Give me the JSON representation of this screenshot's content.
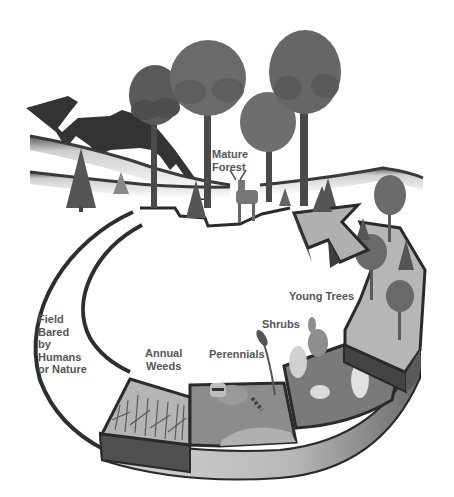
{
  "diagram": {
    "type": "ecological-succession-cycle",
    "colors": {
      "background": "#ffffff",
      "outline": "#2a2a2a",
      "mountain": "#333333",
      "tree_dark": "#4a4a4a",
      "tree_mid": "#6e6e6e",
      "band_top": "#a8a8a8",
      "band_side_dark": "#505050",
      "band_side_light": "#c4c4c4",
      "label_text": "#555555"
    },
    "stages": [
      {
        "id": "field",
        "label": "Field\nBared\nby\nHumans\nor Nature",
        "x": 38,
        "y": 313
      },
      {
        "id": "annual-weeds",
        "label": "Annual\nWeeds",
        "x": 145,
        "y": 347
      },
      {
        "id": "perennials",
        "label": "Perennials",
        "x": 209,
        "y": 348
      },
      {
        "id": "shrubs",
        "label": "Shrubs",
        "x": 262,
        "y": 318
      },
      {
        "id": "young-trees",
        "label": "Young Trees",
        "x": 289,
        "y": 290
      },
      {
        "id": "mature-forest",
        "label": "Mature\nForest",
        "x": 212,
        "y": 148
      }
    ]
  }
}
